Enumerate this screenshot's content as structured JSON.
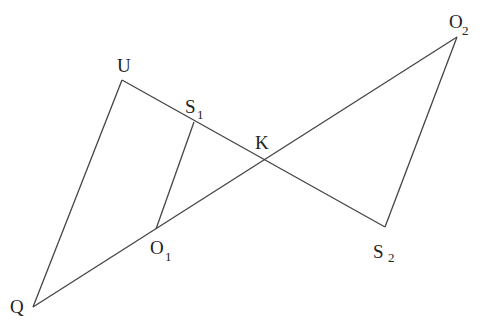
{
  "diagram": {
    "points": {
      "U": {
        "x": 122,
        "y": 80
      },
      "S1": {
        "x": 194,
        "y": 122
      },
      "K": {
        "x": 262,
        "y": 160
      },
      "O2": {
        "x": 457,
        "y": 37
      },
      "S2": {
        "x": 385,
        "y": 227
      },
      "O1": {
        "x": 156,
        "y": 229
      },
      "Q": {
        "x": 33,
        "y": 307
      }
    },
    "labels": {
      "U": {
        "main": "U"
      },
      "S1": {
        "main": "S",
        "sub": "1"
      },
      "K": {
        "main": "K"
      },
      "O2": {
        "main": "O",
        "sub": "2"
      },
      "S2": {
        "main": "S",
        "sub": "2"
      },
      "O1": {
        "main": "O",
        "sub": "1"
      },
      "Q": {
        "main": "Q"
      }
    },
    "segments": [
      [
        "U",
        "S2"
      ],
      [
        "Q",
        "O2"
      ],
      [
        "U",
        "Q"
      ],
      [
        "S1",
        "O1"
      ],
      [
        "O2",
        "S2"
      ]
    ]
  }
}
